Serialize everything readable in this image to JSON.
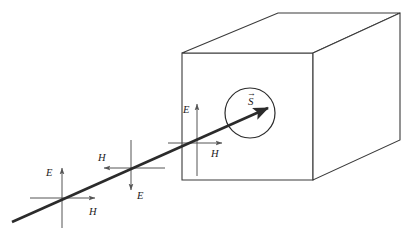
{
  "figure": {
    "type": "physics-diagram",
    "background_color": "#ffffff",
    "line_color": "#3a3a3a",
    "ray_color": "#2b2b2b",
    "axis_color": "#555555",
    "text_color": "#1a1a1a"
  },
  "box": {
    "name": "rectangular-box",
    "front_face": {
      "left": 182,
      "top": 53,
      "right": 313,
      "bottom": 180
    },
    "depth_offset": {
      "dx": 96,
      "dy": -40
    },
    "vertices": {
      "front_top_left": [
        182,
        53
      ],
      "front_top_right": [
        313,
        53
      ],
      "front_bottom_left": [
        182,
        180
      ],
      "front_bottom_right": [
        313,
        180
      ],
      "back_top_left": [
        278,
        13
      ],
      "back_top_right": [
        400,
        13
      ],
      "back_bottom_right": [
        400,
        140
      ]
    }
  },
  "aperture": {
    "name": "circular-aperture",
    "center": [
      250,
      113
    ],
    "radius": 25
  },
  "ray": {
    "name": "propagation-ray",
    "start": [
      12,
      222
    ],
    "end": [
      268,
      108
    ],
    "width": 2.6,
    "arrowhead": true
  },
  "field_clusters": [
    {
      "id": "cluster-1",
      "origin": [
        62,
        198
      ],
      "e_direction": "up",
      "e_label": "E",
      "e_label_pos": [
        46,
        172
      ],
      "e_tip": [
        62,
        168
      ],
      "e_base": [
        62,
        228
      ],
      "h_direction": "right",
      "h_label": "H",
      "h_label_pos": [
        92,
        212
      ],
      "h_tip": [
        95,
        198
      ],
      "h_base": [
        30,
        198
      ]
    },
    {
      "id": "cluster-2",
      "origin": [
        131,
        168
      ],
      "e_direction": "down",
      "e_label": "E",
      "e_label_pos": [
        140,
        196
      ],
      "e_tip": [
        131,
        190
      ],
      "e_base": [
        131,
        140
      ],
      "h_direction": "left",
      "h_label": "H",
      "h_label_pos": [
        101,
        158
      ],
      "h_tip": [
        104,
        168
      ],
      "h_base": [
        165,
        168
      ]
    },
    {
      "id": "cluster-3",
      "origin": [
        197,
        143
      ],
      "e_direction": "up",
      "e_label": "E",
      "e_label_pos": [
        184,
        110
      ],
      "e_tip": [
        197,
        104
      ],
      "e_base": [
        197,
        176
      ],
      "h_direction": "right",
      "h_label": "H",
      "h_label_pos": [
        213,
        153
      ],
      "h_tip": [
        222,
        143
      ],
      "h_base": [
        168,
        143
      ]
    }
  ],
  "poynting_vector": {
    "name": "poynting-vector",
    "label": "S",
    "accent": "→",
    "label_pos": [
      248,
      101
    ],
    "accent_pos": [
      248,
      93
    ]
  }
}
